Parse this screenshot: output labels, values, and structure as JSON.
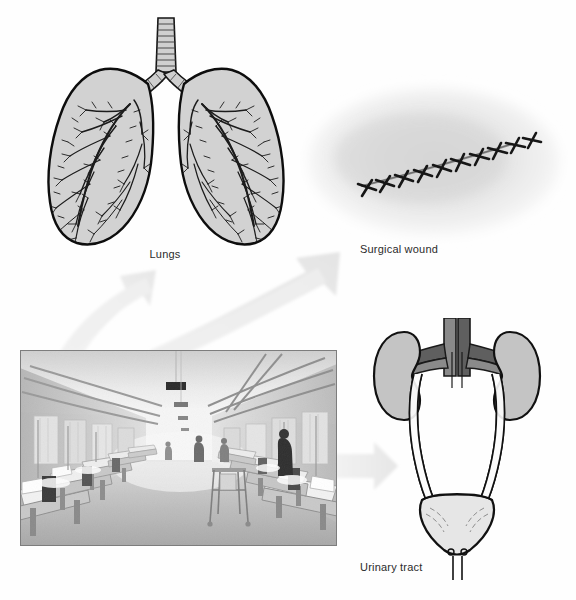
{
  "document": {
    "type": "medical-educational-figure",
    "background_color": "#fefefe",
    "theme": "Common sites of hospital-acquired infection"
  },
  "panels": [
    {
      "id": "lungs",
      "caption": "Lungs",
      "icon_name": "lungs-illustration",
      "description": "Line drawing of a pair of lungs with trachea, bronchi and a dense branching bronchial tree",
      "fill_color": "#d2d2d2",
      "outline_color": "#111111",
      "tree_color": "#1a1a1a"
    },
    {
      "id": "surgical-wound",
      "caption": "Surgical wound",
      "icon_name": "surgical-wound-photo",
      "description": "Close-up photograph of a sutured diagonal surgical incision on pale skin",
      "skin_color": "#e9e9e9",
      "suture_color": "#1c1c1c",
      "stitch_count": 10
    },
    {
      "id": "urinary-tract",
      "caption": "Urinary tract",
      "icon_name": "urinary-tract-illustration",
      "description": "Diagram of two kidneys, renal vessels, ureters, bladder and urethra",
      "kidney_color": "#c4c4c4",
      "vessel_color": "#8a8a8a",
      "vessel_dark_color": "#5c5c5c",
      "bladder_color": "#e4e4e4",
      "outline_color": "#1a1a1a"
    },
    {
      "id": "hospital-ward",
      "caption": "",
      "icon_name": "hospital-ward-photograph",
      "description": "Black and white photograph of a long hospital ward with two rows of beds, curtains, ceiling lights and staff",
      "tone_light": "#e6e6e6",
      "tone_mid": "#9a9a9a",
      "tone_dark": "#2a2a2a"
    }
  ],
  "arrows": [
    {
      "id": "arrow-to-lungs",
      "label": "",
      "direction": "up-left",
      "from": "hospital-ward",
      "to": "lungs",
      "color": "#eeeeee"
    },
    {
      "id": "arrow-to-wound",
      "label": "",
      "direction": "up-right",
      "from": "hospital-ward",
      "to": "surgical-wound",
      "color": "#ededed"
    },
    {
      "id": "arrow-to-urinary",
      "label": "",
      "direction": "right",
      "from": "hospital-ward",
      "to": "urinary-tract",
      "color": "#ececec"
    }
  ],
  "captions": {
    "lungs": "Lungs",
    "surgical_wound": "Surgical wound",
    "urinary_tract": "Urinary tract"
  }
}
